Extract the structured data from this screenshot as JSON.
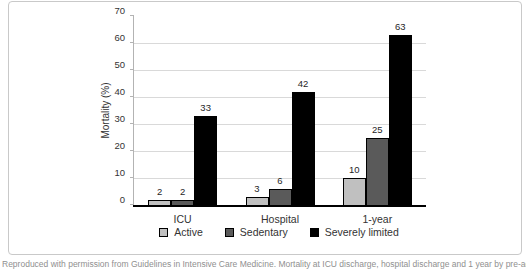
{
  "figure": {
    "caption": "Reproduced with permission from Guidelines in Intensive Care Medicine. Mortality at ICU discharge, hospital discharge and 1 year by pre-admission activity level. www."
  },
  "chart_data": {
    "type": "bar",
    "categories": [
      "ICU",
      "Hospital",
      "1-year"
    ],
    "series": [
      {
        "name": "Active",
        "color": "#c0c0c0",
        "values": [
          2,
          3,
          10
        ]
      },
      {
        "name": "Sedentary",
        "color": "#5a5a5a",
        "values": [
          2,
          6,
          25
        ]
      },
      {
        "name": "Severely limited",
        "color": "#000000",
        "values": [
          33,
          42,
          63
        ]
      }
    ],
    "title": "",
    "xlabel": "",
    "ylabel": "Mortality (%)",
    "ylim": [
      0,
      70
    ],
    "ytick_step": 10,
    "grid": "horizontal",
    "legend_position": "bottom",
    "colors": {
      "gridline": "#d9d9d9",
      "y_axis_line": "#b3b3b3",
      "baseline": "#000000",
      "text": "#333333"
    }
  }
}
